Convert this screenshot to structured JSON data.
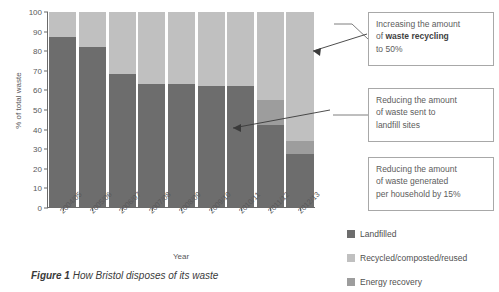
{
  "figure": {
    "caption_label": "Figure 1",
    "caption_text": "How Bristol disposes of its waste"
  },
  "chart_data": {
    "type": "bar",
    "stacked": true,
    "title": "",
    "xlabel": "Year",
    "ylabel": "% of total waste",
    "ylim": [
      0,
      100
    ],
    "yticks": [
      0,
      10,
      20,
      30,
      40,
      50,
      60,
      70,
      80,
      90,
      100
    ],
    "grid": false,
    "legend_position": "bottom-right",
    "categories": [
      "2004/05",
      "2005/06",
      "2006/07",
      "2007/08",
      "2008/09",
      "2009/10",
      "2010/11",
      "2011/12",
      "2012/13"
    ],
    "series": [
      {
        "name": "Landfilled",
        "color": "#6d6d6d",
        "values": [
          87,
          82,
          68,
          63,
          63,
          62,
          62,
          42,
          27
        ]
      },
      {
        "name": "Energy recovery",
        "color": "#9d9d9d",
        "values": [
          0,
          0,
          0,
          0,
          0,
          0,
          0,
          13,
          7
        ]
      },
      {
        "name": "Recycled/composted/reused",
        "color": "#c0c0c0",
        "values": [
          13,
          18,
          32,
          37,
          37,
          38,
          38,
          45,
          66
        ]
      }
    ]
  },
  "annotations": [
    {
      "id": "callout-1",
      "line1": "Increasing the amount",
      "line2_prefix": "of ",
      "line2_bold": "waste recycling",
      "line3": "to 50%"
    },
    {
      "id": "callout-2",
      "line1": "Reducing the amount",
      "line2": "of waste sent to",
      "line3": "landfill sites"
    },
    {
      "id": "callout-3",
      "line1": "Reducing the amount",
      "line2": "of waste generated",
      "line3": "per household by 15%"
    }
  ]
}
